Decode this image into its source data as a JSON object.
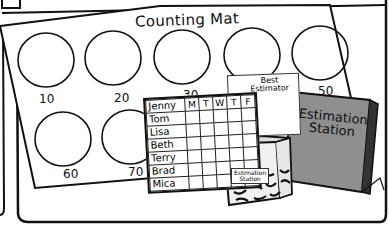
{
  "scene": {
    "description": "Classroom estimation clip art: counting mat with numbered circles, weekly name chart, Best Estimator certificate, Estimation Station jar and book",
    "counting_mat": {
      "title": "Counting Mat",
      "circle_labels": [
        "10",
        "20",
        "30",
        "40",
        "50",
        "60",
        "70"
      ]
    },
    "chart": {
      "days": [
        "M",
        "T",
        "W",
        "T",
        "F"
      ],
      "names": [
        "Jenny",
        "Tom",
        "Lisa",
        "Beth",
        "Terry",
        "Brad",
        "Mica"
      ]
    },
    "certificate": {
      "title_line1": "Best",
      "title_line2": "Estimator"
    },
    "jar": {
      "label_line1": "Estimation",
      "label_line2": "Station"
    },
    "book": {
      "title_line1": "Estimation",
      "title_line2": "Station"
    },
    "colors": {
      "ink": "#111111",
      "book_fill": "#8f8f8f",
      "paper": "#ffffff"
    }
  }
}
